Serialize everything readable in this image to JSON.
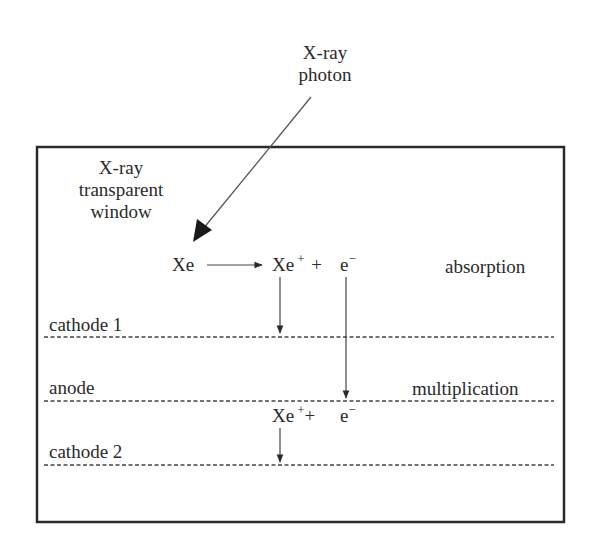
{
  "diagram": {
    "type": "gas-proportional-counter-schematic",
    "photon_label": {
      "line1": "X-ray",
      "line2": "photon"
    },
    "window_label": {
      "line1": "X-ray",
      "line2": "transparent",
      "line3": "window"
    },
    "reaction_top": {
      "reactant": "Xe",
      "ion": "Xe",
      "ion_charge": "+",
      "plus": "+",
      "electron": "e",
      "electron_charge": "−"
    },
    "reaction_bottom": {
      "ion": "Xe",
      "ion_charge": "+",
      "plus": "+",
      "electron": "e",
      "electron_charge": "−"
    },
    "regions": {
      "absorption": "absorption",
      "multiplication": "multiplication"
    },
    "electrodes": [
      {
        "label": "cathode 1",
        "line_style": "dashed"
      },
      {
        "label": "anode",
        "line_style": "dashed"
      },
      {
        "label": "cathode 2",
        "line_style": "dashed"
      }
    ],
    "colors": {
      "ink": "#2a2a2a",
      "background": "#ffffff"
    }
  }
}
